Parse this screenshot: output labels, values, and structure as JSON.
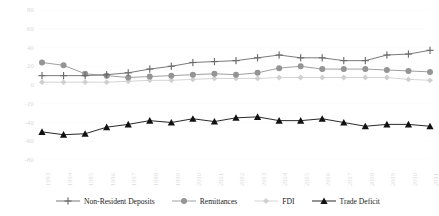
{
  "chart_data": {
    "type": "line",
    "title": "",
    "xlabel": "",
    "ylabel": "",
    "ylim": [
      -80,
      80
    ],
    "ytick_values": [
      80,
      60,
      40,
      20,
      0,
      -20,
      -40,
      -60,
      -80
    ],
    "ytick_labels": [
      "80",
      "60",
      "40",
      "20",
      "0",
      "-20",
      "-40",
      "-60",
      "-80"
    ],
    "grid": false,
    "legend_position": "bottom",
    "categories": [
      "1993",
      "1994",
      "1995",
      "1996",
      "1997",
      "1998",
      "1999",
      "2000",
      "2001",
      "2002",
      "2003",
      "2004",
      "2005",
      "2006",
      "2007",
      "2008",
      "2009",
      "2010",
      "2011"
    ],
    "series": [
      {
        "name": "Non-Resident Deposits",
        "marker": "plus",
        "color": "#6b6b6b",
        "values": [
          10,
          10,
          10,
          11,
          13,
          17,
          20,
          24,
          25,
          26,
          29,
          32,
          29,
          29,
          26,
          26,
          32,
          33,
          37
        ]
      },
      {
        "name": "Remittances",
        "marker": "circle",
        "color": "#949494",
        "values": [
          24,
          21,
          12,
          10,
          8,
          9,
          10,
          11,
          12,
          11,
          13,
          18,
          20,
          17,
          17,
          17,
          16,
          15,
          14
        ]
      },
      {
        "name": "FDI",
        "marker": "diamond",
        "color": "#cfcfcf",
        "values": [
          3,
          3,
          3,
          3,
          4,
          5,
          5,
          6,
          7,
          7,
          7,
          8,
          8,
          8,
          8,
          8,
          8,
          6,
          5
        ]
      },
      {
        "name": "Trade Deficit",
        "marker": "triangle",
        "color": "#111111",
        "values": [
          -50,
          -53,
          -52,
          -45,
          -42,
          -38,
          -40,
          -36,
          -39,
          -35,
          -34,
          -38,
          -38,
          -36,
          -40,
          -44,
          -42,
          -42,
          -44
        ]
      }
    ]
  },
  "legend": {
    "items": [
      {
        "label": "Non-Resident Deposits",
        "marker": "plus-marker-icon"
      },
      {
        "label": "Remittances",
        "marker": "circle-marker-icon"
      },
      {
        "label": "FDI",
        "marker": "diamond-marker-icon"
      },
      {
        "label": "Trade Deficit",
        "marker": "triangle-marker-icon"
      }
    ]
  }
}
